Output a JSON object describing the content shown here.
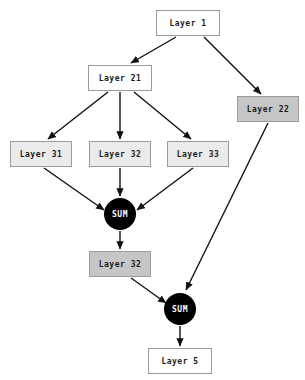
{
  "diagram": {
    "type": "flowchart",
    "orientation": "top-to-bottom",
    "background_color": "#ffffff",
    "colors": {
      "box_border": "#9a9a9a",
      "fill_white": "#ffffff",
      "fill_light_gray": "#ebebeb",
      "fill_gray": "#c6c6c6",
      "sum_node": "#000000",
      "sum_text": "#ffffff",
      "edge": "#111111",
      "label_text": "#1a1a1a"
    },
    "nodes": [
      {
        "id": "layer1",
        "label": "Layer 1",
        "shape": "rect",
        "fill": "white",
        "x": 156,
        "y": 10,
        "w": 64,
        "h": 26
      },
      {
        "id": "layer21",
        "label": "Layer 21",
        "shape": "rect",
        "fill": "white",
        "x": 88,
        "y": 65,
        "w": 64,
        "h": 26
      },
      {
        "id": "layer22",
        "label": "Layer 22",
        "shape": "rect",
        "fill": "gray",
        "x": 237,
        "y": 96,
        "w": 62,
        "h": 26
      },
      {
        "id": "layer31",
        "label": "Layer 31",
        "shape": "rect",
        "fill": "light",
        "x": 10,
        "y": 141,
        "w": 62,
        "h": 26
      },
      {
        "id": "layer32a",
        "label": "Layer 32",
        "shape": "rect",
        "fill": "light",
        "x": 89,
        "y": 141,
        "w": 62,
        "h": 26
      },
      {
        "id": "layer33",
        "label": "Layer 33",
        "shape": "rect",
        "fill": "light",
        "x": 167,
        "y": 141,
        "w": 62,
        "h": 26
      },
      {
        "id": "sum1",
        "label": "SUM",
        "shape": "circle",
        "fill": "black",
        "x": 104,
        "y": 198,
        "w": 32,
        "h": 32
      },
      {
        "id": "layer32b",
        "label": "Layer 32",
        "shape": "rect",
        "fill": "gray",
        "x": 89,
        "y": 251,
        "w": 62,
        "h": 26
      },
      {
        "id": "sum2",
        "label": "SUM",
        "shape": "circle",
        "fill": "black",
        "x": 164,
        "y": 293,
        "w": 32,
        "h": 32
      },
      {
        "id": "layer5",
        "label": "Layer 5",
        "shape": "rect",
        "fill": "white",
        "x": 148,
        "y": 348,
        "w": 64,
        "h": 26
      }
    ],
    "edges": [
      {
        "from": "layer1",
        "to": "layer21",
        "x1": 176,
        "y1": 37,
        "x2": 131,
        "y2": 63
      },
      {
        "from": "layer1",
        "to": "layer22",
        "x1": 204,
        "y1": 37,
        "x2": 261,
        "y2": 94
      },
      {
        "from": "layer21",
        "to": "layer31",
        "x1": 108,
        "y1": 92,
        "x2": 48,
        "y2": 139
      },
      {
        "from": "layer21",
        "to": "layer32a",
        "x1": 120,
        "y1": 92,
        "x2": 120,
        "y2": 139
      },
      {
        "from": "layer21",
        "to": "layer33",
        "x1": 134,
        "y1": 92,
        "x2": 191,
        "y2": 139
      },
      {
        "from": "layer31",
        "to": "sum1",
        "x1": 44,
        "y1": 168,
        "x2": 104,
        "y2": 210
      },
      {
        "from": "layer32a",
        "to": "sum1",
        "x1": 120,
        "y1": 168,
        "x2": 120,
        "y2": 196
      },
      {
        "from": "layer33",
        "to": "sum1",
        "x1": 193,
        "y1": 168,
        "x2": 137,
        "y2": 210
      },
      {
        "from": "sum1",
        "to": "layer32b",
        "x1": 120,
        "y1": 231,
        "x2": 120,
        "y2": 249
      },
      {
        "from": "layer32b",
        "to": "sum2",
        "x1": 131,
        "y1": 278,
        "x2": 166,
        "y2": 303
      },
      {
        "from": "layer22",
        "to": "sum2",
        "x1": 268,
        "y1": 123,
        "x2": 186,
        "y2": 290
      },
      {
        "from": "sum2",
        "to": "layer5",
        "x1": 180,
        "y1": 326,
        "x2": 180,
        "y2": 346
      }
    ]
  }
}
